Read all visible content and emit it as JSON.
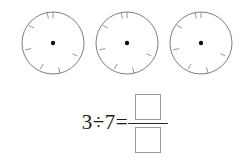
{
  "page": {
    "kind": "math-worksheet",
    "background_color": "#ffffff",
    "ink_color": "#1a1a1a"
  },
  "figures": {
    "label": "three circles divided into sevenths",
    "count": 3,
    "circle": {
      "radius": 31,
      "stroke_color": "#6e6e78",
      "stroke_width": 0.9,
      "tick_count": 7,
      "tick_inner_length": 6,
      "tick_color": "#8a8a92",
      "tick_start_angle_deg": -90,
      "center_dot_radius": 2.2,
      "center_dot_color": "#111111"
    },
    "items": [
      {
        "name": "circle-1",
        "cx": 37,
        "cy": 43
      },
      {
        "name": "circle-2",
        "cx": 37,
        "cy": 43
      },
      {
        "name": "circle-3",
        "cx": 37,
        "cy": 43
      }
    ],
    "positions_x": [
      16,
      90,
      164
    ]
  },
  "equation": {
    "dividend": "3",
    "divisor": "7",
    "division_sign": "÷",
    "equals_sign": "=",
    "lhs_text": "3÷7=",
    "numerator_value": "",
    "denominator_value": "",
    "numerator_placeholder": "",
    "denominator_placeholder": "",
    "fraction_bar_color": "#2a2a2a",
    "answer_box_border_color": "#9a9a9a"
  }
}
